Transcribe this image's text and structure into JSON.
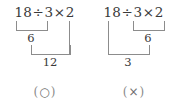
{
  "figure": {
    "expression": "18 ÷ 3 × 2",
    "ink_color": "#3a3a3a",
    "rule_color": "#8c8c8c",
    "background_color": "#ffffff"
  },
  "panels": [
    {
      "id": "correct",
      "expression_parts": {
        "operand1": "18",
        "operator1": "÷",
        "operand2": "3",
        "operator2": "×",
        "operand3": "2"
      },
      "step1": {
        "grouped": "18 ÷ 3",
        "result": "6"
      },
      "step2": {
        "grouped": "6 × 2",
        "result": "12"
      },
      "verdict": {
        "open_paren": "(",
        "mark": "○",
        "close_paren": ")",
        "meaning": "correct"
      }
    },
    {
      "id": "incorrect",
      "expression_parts": {
        "operand1": "18",
        "operator1": "÷",
        "operand2": "3",
        "operator2": "×",
        "operand3": "2"
      },
      "step1": {
        "grouped": "3 × 2",
        "result": "6"
      },
      "step2": {
        "grouped": "18 ÷ 6",
        "result": "3"
      },
      "verdict": {
        "open_paren": "(",
        "mark": "×",
        "close_paren": ")",
        "meaning": "incorrect"
      }
    }
  ]
}
